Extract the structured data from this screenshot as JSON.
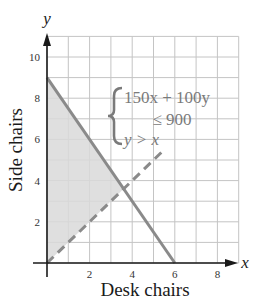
{
  "chart_data": {
    "type": "line",
    "title": "",
    "xlabel": "Desk chairs",
    "ylabel": "Side chairs",
    "x_axis_letter": "x",
    "y_axis_letter": "y",
    "xlim": [
      0,
      9
    ],
    "ylim": [
      0,
      11
    ],
    "grid": true,
    "x_ticks": [
      2,
      4,
      6,
      8
    ],
    "y_ticks": [
      2,
      4,
      6,
      8,
      10
    ],
    "x_tick_labels": [
      "2",
      "4",
      "6",
      "8"
    ],
    "y_tick_labels": [
      "2",
      "4",
      "6",
      "8",
      "10"
    ],
    "series": [
      {
        "name": "150x + 100y = 900",
        "style": "solid",
        "points": [
          [
            0,
            9
          ],
          [
            6,
            0
          ]
        ]
      },
      {
        "name": "y = x",
        "style": "dashed",
        "points": [
          [
            0,
            0
          ],
          [
            5.4,
            5.4
          ]
        ]
      }
    ],
    "shaded_region": {
      "description": "Solution region: 150x + 100y ≤ 900 and y > x",
      "vertices": [
        [
          0,
          0
        ],
        [
          0,
          9
        ],
        [
          3.6,
          3.6
        ]
      ]
    },
    "annotation": {
      "type": "system-of-inequalities",
      "lines": [
        "150x + 100y",
        "≤ 900",
        "y > x"
      ]
    },
    "colors": {
      "shade": "#d9d9d9",
      "lines": "#8a8a8a",
      "grid": "#c4c4c4",
      "axes": "#1a1a1a",
      "annotation": "#7a7a7a"
    }
  }
}
